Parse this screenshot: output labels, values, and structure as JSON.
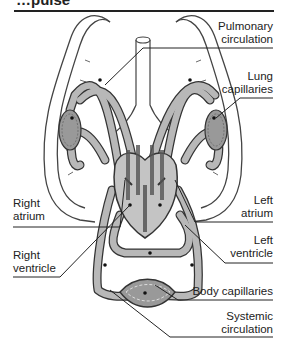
{
  "header": {
    "title_fragment": "…pulse",
    "note": "title text is cropped off at the top edge"
  },
  "diagram": {
    "colors": {
      "vessel_fill": "#b8b8b8",
      "vessel_stroke": "#333333",
      "heart_fill": "#c4c4c4",
      "lung_outline": "#444444",
      "line": "#222222",
      "background": "#ffffff"
    },
    "labels": {
      "pulmonary_circulation": [
        "Pulmonary",
        "circulation"
      ],
      "lung_capillaries": [
        "Lung",
        "capillaries"
      ],
      "right_atrium": [
        "Right",
        "atrium"
      ],
      "right_ventricle": [
        "Right",
        "ventricle"
      ],
      "left_atrium": [
        "Left",
        "atrium"
      ],
      "left_ventricle": [
        "Left",
        "ventricle"
      ],
      "body_capillaries": [
        "Body capillaries"
      ],
      "systemic_circulation": [
        "Systemic",
        "circulation"
      ]
    }
  }
}
